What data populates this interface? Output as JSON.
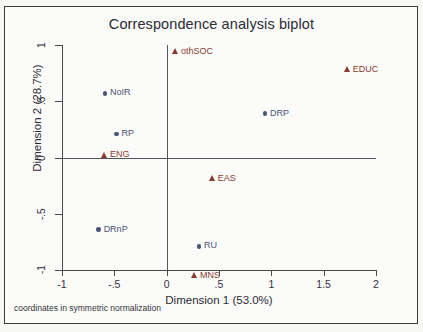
{
  "chart_data": {
    "type": "scatter",
    "title": "Correspondence analysis biplot",
    "xlabel": "Dimension 1 (53.0%)",
    "ylabel": "Dimension 2 (28.7%)",
    "note": "coordinates in symmetric normalization",
    "xlim": [
      -1,
      2
    ],
    "ylim": [
      -1,
      1
    ],
    "xticks": [
      "-1",
      "-.5",
      "0",
      ".5",
      "1",
      "1.5",
      "2"
    ],
    "xtick_values": [
      -1,
      -0.5,
      0,
      0.5,
      1,
      1.5,
      2
    ],
    "yticks": [
      "1",
      ".5",
      "0",
      "-.5",
      "-1"
    ],
    "ytick_values": [
      1,
      0.5,
      0,
      -0.5,
      -1
    ],
    "grid": false,
    "legend": "none",
    "reference_lines": {
      "x": 0,
      "y": 0
    },
    "colors": {
      "row_points": "#4a5478",
      "col_points": "#8c3a2e",
      "axis": "#4a4a4a",
      "background": "#fbfbfa"
    },
    "series": [
      {
        "name": "row points",
        "marker": "circle",
        "color": "#4a5478",
        "points": [
          {
            "label": "NoIR",
            "x": -0.59,
            "y": 0.57
          },
          {
            "label": "RP",
            "x": -0.48,
            "y": 0.21
          },
          {
            "label": "DRP",
            "x": 0.94,
            "y": 0.39
          },
          {
            "label": "DRnP",
            "x": -0.65,
            "y": -0.64
          },
          {
            "label": "RU",
            "x": 0.31,
            "y": -0.79
          }
        ]
      },
      {
        "name": "column points",
        "marker": "triangle",
        "color": "#8c3a2e",
        "points": [
          {
            "label": "othSOC",
            "x": 0.09,
            "y": 0.94
          },
          {
            "label": "EDUC",
            "x": 1.73,
            "y": 0.78
          },
          {
            "label": "ENG",
            "x": -0.59,
            "y": 0.02
          },
          {
            "label": "EAS",
            "x": 0.44,
            "y": -0.19
          },
          {
            "label": "MNS",
            "x": 0.27,
            "y": -1.05
          }
        ]
      }
    ]
  }
}
